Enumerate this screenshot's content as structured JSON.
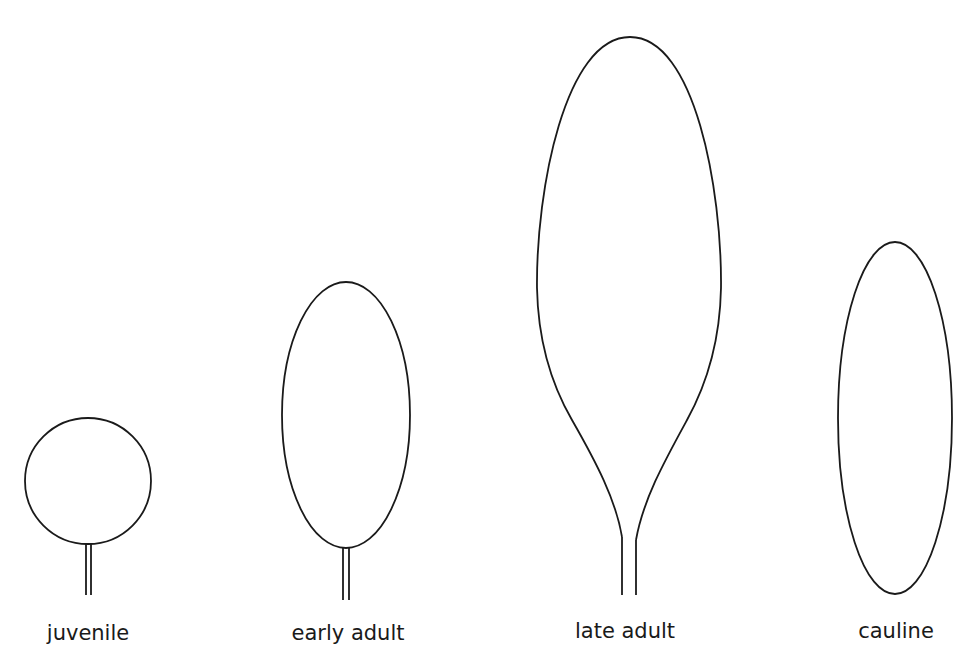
{
  "diagram": {
    "type": "leaf-shape-series",
    "stroke_color": "#1a1a1a",
    "background": "#ffffff",
    "leaves": [
      {
        "id": "juvenile",
        "label": "juvenile",
        "shape": "circle",
        "has_petiole": true
      },
      {
        "id": "early-adult",
        "label": "early adult",
        "shape": "ellipse",
        "has_petiole": true
      },
      {
        "id": "late-adult",
        "label": "late adult",
        "shape": "obovate-tapered",
        "has_petiole": true
      },
      {
        "id": "cauline",
        "label": "cauline",
        "shape": "narrow-ellipse",
        "has_petiole": false
      }
    ]
  }
}
